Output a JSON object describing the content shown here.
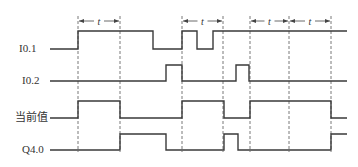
{
  "diagram": {
    "type": "timing-diagram",
    "time_label": "t",
    "dashed_lines_x": [
      78,
      120,
      182,
      223,
      250,
      289,
      331
    ],
    "t_intervals": [
      [
        78,
        120
      ],
      [
        182,
        223
      ],
      [
        250,
        289
      ],
      [
        289,
        331
      ]
    ],
    "signals": [
      {
        "name": "I0.1",
        "label": "I0.1",
        "high_y": 31,
        "low_y": 49,
        "transitions": [
          [
            50,
            0
          ],
          [
            78,
            1
          ],
          [
            153,
            0
          ],
          [
            182,
            1
          ],
          [
            197,
            0
          ],
          [
            213,
            1
          ]
        ],
        "end_x": 347
      },
      {
        "name": "I0.2",
        "label": "I0.2",
        "high_y": 65,
        "low_y": 81,
        "transitions": [
          [
            50,
            0
          ],
          [
            166,
            1
          ],
          [
            182,
            0
          ],
          [
            236,
            1
          ],
          [
            249,
            0
          ]
        ],
        "end_x": 347
      },
      {
        "name": "current-value",
        "label": "当前值",
        "high_y": 101,
        "low_y": 118,
        "transitions": [
          [
            50,
            0
          ],
          [
            78,
            1
          ],
          [
            120,
            0
          ],
          [
            182,
            1
          ],
          [
            224,
            0
          ],
          [
            250,
            1
          ],
          [
            331,
            0
          ]
        ],
        "end_x": 347
      },
      {
        "name": "Q4.0",
        "label": "Q4.0",
        "high_y": 134,
        "low_y": 150,
        "transitions": [
          [
            50,
            0
          ],
          [
            120,
            1
          ],
          [
            166,
            0
          ],
          [
            224,
            1
          ],
          [
            238,
            0
          ],
          [
            331,
            1
          ]
        ],
        "end_x": 347
      }
    ]
  }
}
